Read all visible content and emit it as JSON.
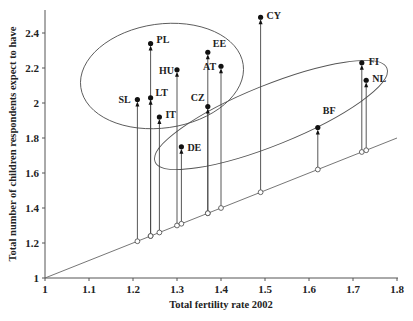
{
  "chart_data": {
    "type": "scatter",
    "title": "",
    "xlabel": "Total fertility rate 2002",
    "ylabel": "Total number of children respondents expect to have",
    "xlim": [
      1,
      1.8
    ],
    "ylim": [
      1,
      2.5
    ],
    "x_ticks": [
      "1",
      "1.1",
      "1.2",
      "1.3",
      "1.4",
      "1.5",
      "1.6",
      "1.7",
      "1.8"
    ],
    "y_ticks": [
      "1",
      "1.2",
      "1.4",
      "1.6",
      "1.8",
      "2",
      "2.2",
      "2.4"
    ],
    "grid": false,
    "reference_line": "y = x (diagonal, hollow circles mark each country's TFR on the line)",
    "series": [
      {
        "name": "SL",
        "x": 1.21,
        "y": 2.02
      },
      {
        "name": "PL",
        "x": 1.24,
        "y": 2.34
      },
      {
        "name": "LT",
        "x": 1.24,
        "y": 2.03
      },
      {
        "name": "IT",
        "x": 1.26,
        "y": 1.92
      },
      {
        "name": "HU",
        "x": 1.3,
        "y": 2.19
      },
      {
        "name": "DE",
        "x": 1.31,
        "y": 1.75
      },
      {
        "name": "EE",
        "x": 1.37,
        "y": 2.29
      },
      {
        "name": "CZ",
        "x": 1.37,
        "y": 1.98
      },
      {
        "name": "AT",
        "x": 1.4,
        "y": 2.21
      },
      {
        "name": "CY",
        "x": 1.49,
        "y": 2.49
      },
      {
        "name": "BF",
        "x": 1.62,
        "y": 1.86
      },
      {
        "name": "FI",
        "x": 1.72,
        "y": 2.23
      },
      {
        "name": "NL",
        "x": 1.73,
        "y": 2.13
      }
    ],
    "label_offsets": {
      "SL": [
        -19,
        3
      ],
      "PL": [
        6,
        -1
      ],
      "LT": [
        5,
        -2
      ],
      "IT": [
        6,
        1
      ],
      "HU": [
        -18,
        4
      ],
      "DE": [
        6,
        4
      ],
      "EE": [
        5,
        -5
      ],
      "CZ": [
        -17,
        -6
      ],
      "AT": [
        -18,
        4
      ],
      "CY": [
        6,
        2
      ],
      "BF": [
        5,
        -14
      ],
      "FI": [
        7,
        2
      ],
      "NL": [
        6,
        2
      ]
    },
    "annotations": [
      {
        "type": "ellipse",
        "group": [
          "SL",
          "PL",
          "LT",
          "IT",
          "HU",
          "EE",
          "AT",
          "CZ"
        ],
        "cx": 162,
        "cy": 76,
        "rx": 82,
        "ry": 52,
        "rotate": -8
      },
      {
        "type": "ellipse",
        "group": [
          "DE",
          "BF",
          "FI",
          "NL"
        ],
        "cx": 271,
        "cy": 115,
        "rx": 125,
        "ry": 30,
        "rotate": -22
      }
    ]
  }
}
